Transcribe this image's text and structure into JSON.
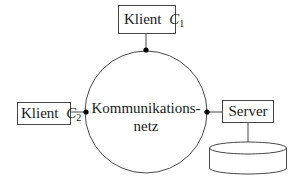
{
  "diagram": {
    "network": {
      "line1": "Kommunikations-",
      "line2": "netz"
    },
    "nodes": [
      {
        "id": "client1",
        "label": "Klient",
        "symbol": "C",
        "subscript": "1"
      },
      {
        "id": "client2",
        "label": "Klient",
        "symbol": "C",
        "subscript": "2"
      },
      {
        "id": "server",
        "label": "Server"
      }
    ],
    "database": {
      "shape": "cylinder",
      "label": ""
    },
    "colors": {
      "stroke": "#2a2a2a",
      "background": "#ffffff"
    }
  }
}
